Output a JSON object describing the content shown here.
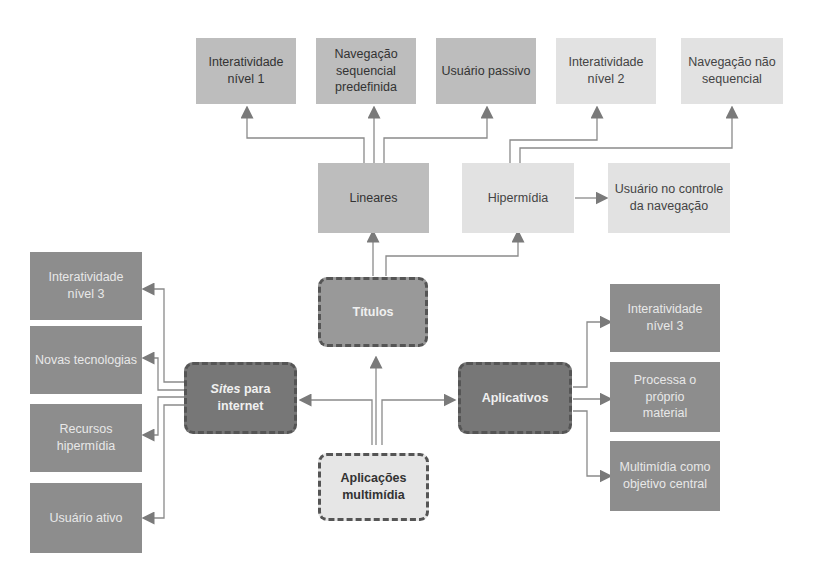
{
  "diagram": {
    "root": {
      "label": "Aplicações\nmultimídia"
    },
    "branches": {
      "titulos": {
        "label": "Títulos"
      },
      "sites": {
        "label_italic": "Sites",
        "label_rest": " para\ninternet"
      },
      "aplicativos": {
        "label": "Aplicativos"
      }
    },
    "titulos_children": {
      "lineares": {
        "label": "Lineares"
      },
      "hipermidia": {
        "label": "Hipermídia"
      }
    },
    "lineares_children": [
      {
        "label": "Interatividade\nnível 1"
      },
      {
        "label": "Navegação\nsequencial\npredefinida"
      },
      {
        "label": "Usuário passivo"
      }
    ],
    "hipermidia_children": [
      {
        "label": "Interatividade\nnível 2"
      },
      {
        "label": "Navegação não\nsequencial"
      },
      {
        "label": "Usuário no controle\nda navegação"
      }
    ],
    "sites_children": [
      {
        "label": "Interatividade\nnível 3"
      },
      {
        "label": "Novas tecnologias"
      },
      {
        "label": "Recursos\nhipermídia"
      },
      {
        "label": "Usuário ativo"
      }
    ],
    "aplicativos_children": [
      {
        "label": "Interatividade\nnível 3"
      },
      {
        "label": "Processa o próprio\nmaterial"
      },
      {
        "label": "Multimídia como\nobjetivo central"
      }
    ]
  },
  "colors": {
    "line": "#8a8a8a",
    "arrow": "#7a7a7a"
  }
}
